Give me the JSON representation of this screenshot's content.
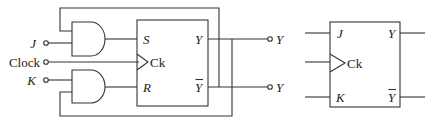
{
  "diagram": {
    "title": "",
    "circuit": {
      "inputs": [
        {
          "label": "J",
          "italic": true
        },
        {
          "label": "Clock",
          "italic": false
        },
        {
          "label": "K",
          "italic": true
        }
      ],
      "outputs": [
        {
          "label": "Y"
        },
        {
          "label": "Y",
          "overbar": true
        }
      ],
      "and_gates": [
        "AND gate (J, feedback Ȳ)",
        "AND gate (K, feedback Y)"
      ],
      "sr_flipflop": {
        "pins_left": [
          "S",
          "Ck",
          "R"
        ],
        "pins_right": [
          "Y",
          "Ȳ"
        ]
      }
    },
    "symbol": {
      "pins_left": [
        "J",
        "Ck",
        "K"
      ],
      "pins_right": [
        "Y",
        "Ȳ"
      ]
    },
    "colors": {
      "line": "#333333",
      "background": "#ffffff"
    }
  }
}
